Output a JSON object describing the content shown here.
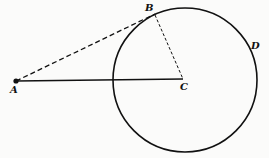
{
  "diagram": {
    "type": "geometry",
    "points": {
      "A": {
        "label": "A",
        "x": 16,
        "y": 81
      },
      "B": {
        "label": "B",
        "x": 155,
        "y": 14
      },
      "C": {
        "label": "C",
        "x": 183,
        "y": 79
      },
      "D": {
        "label": "D",
        "x": 253,
        "y": 46
      }
    },
    "circle": {
      "center": "C",
      "cx": 185,
      "cy": 80,
      "r": 72
    },
    "segments": [
      {
        "from": "A",
        "to": "C",
        "style": "solid"
      },
      {
        "from": "A",
        "to": "B",
        "style": "dashed"
      },
      {
        "from": "B",
        "to": "C",
        "style": "dashed"
      }
    ],
    "colors": {
      "stroke": "#111111",
      "background": "#fbfbfa"
    }
  }
}
